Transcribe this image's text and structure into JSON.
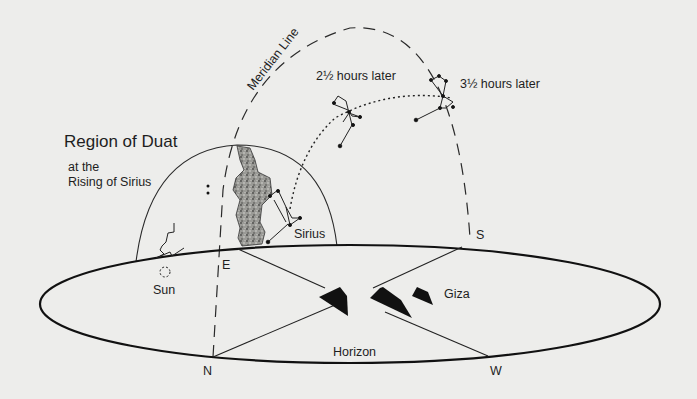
{
  "diagram": {
    "title": "Region of Duat",
    "subtitle_line1": "at the",
    "subtitle_line2": "Rising of Sirius",
    "meridian_label": "Meridian Line",
    "time_labels": {
      "two_half": "2½ hours later",
      "three_half": "3½ hours later"
    },
    "bodies": {
      "sirius": "Sirius",
      "sun": "Sun",
      "giza": "Giza"
    },
    "horizon_label": "Horizon",
    "directions": {
      "east": "E",
      "north": "N",
      "south": "S",
      "west": "W"
    },
    "colors": {
      "background": "#ededeb",
      "ink": "#1c1c1c",
      "milky_way": "#8a8a86"
    }
  }
}
